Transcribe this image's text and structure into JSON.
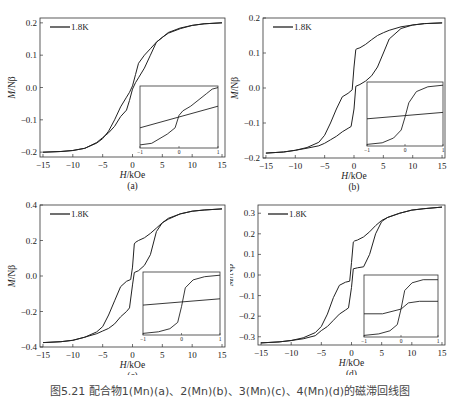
{
  "caption": "图5.21  配合物1(Mn)(a)、2(Mn)(b)、3(Mn)(c)、4(Mn)(d)的磁滞回线图",
  "chart_data": [
    {
      "id": "a",
      "label": "(a)",
      "type": "line",
      "title": "",
      "xlabel": "H/kOe",
      "ylabel": "M/Nβ",
      "xlim": [
        -15.5,
        15.5
      ],
      "ylim": [
        -0.215,
        0.215
      ],
      "xticks": [
        -15,
        -10,
        -5,
        0,
        5,
        10,
        15
      ],
      "yticks": [
        -0.2,
        -0.1,
        0.0,
        0.1,
        0.2
      ],
      "ytick_labels": [
        "-0.2",
        "-0.1",
        "0.0",
        "0.1",
        "0.2"
      ],
      "legend": [
        "1.8K"
      ],
      "legend_position": "upper left",
      "grid": false,
      "series": [
        {
          "name": "1.8K (upper branch)",
          "x": [
            -15,
            -12,
            -10,
            -8,
            -6,
            -5,
            -4,
            -3,
            -2,
            -1,
            -0.5,
            0,
            0.5,
            1,
            2,
            3,
            4,
            5,
            6,
            8,
            10,
            12,
            15
          ],
          "y": [
            -0.2,
            -0.198,
            -0.195,
            -0.188,
            -0.172,
            -0.158,
            -0.135,
            -0.1,
            -0.06,
            -0.03,
            -0.015,
            0.005,
            0.04,
            0.075,
            0.1,
            0.12,
            0.14,
            0.155,
            0.168,
            0.182,
            0.192,
            0.197,
            0.2
          ]
        },
        {
          "name": "1.8K (lower branch)",
          "x": [
            -15,
            -12,
            -10,
            -8,
            -6,
            -5,
            -4,
            -3,
            -2,
            -1,
            -0.5,
            0,
            0.5,
            1,
            2,
            3,
            4,
            5,
            6,
            8,
            10,
            12,
            15
          ],
          "y": [
            -0.2,
            -0.198,
            -0.195,
            -0.188,
            -0.17,
            -0.155,
            -0.14,
            -0.12,
            -0.09,
            -0.07,
            -0.04,
            -0.005,
            0.015,
            0.03,
            0.06,
            0.1,
            0.14,
            0.155,
            0.17,
            0.184,
            0.192,
            0.197,
            0.2
          ]
        }
      ],
      "inset": {
        "xlim": [
          -1,
          1
        ],
        "xtick_labels": [
          "-1",
          "0",
          "1"
        ],
        "series": [
          {
            "name": "virgin/linear",
            "x": [
              -1,
              1
            ],
            "y": [
              -0.35,
              0.35
            ]
          },
          {
            "name": "loop",
            "x": [
              -1,
              -0.7,
              -0.3,
              -0.1,
              0,
              0.1,
              0.3,
              0.7,
              0.85,
              1
            ],
            "y": [
              -0.9,
              -0.85,
              -0.55,
              -0.35,
              0.05,
              0.2,
              0.35,
              0.75,
              0.9,
              0.95
            ]
          }
        ]
      }
    },
    {
      "id": "b",
      "label": "(b)",
      "type": "line",
      "title": "",
      "xlabel": "H/kOe",
      "ylabel": "M/Nβ",
      "xlim": [
        -15.5,
        15.5
      ],
      "ylim": [
        -0.2,
        0.2
      ],
      "xticks": [
        -15,
        -10,
        -5,
        0,
        5,
        10,
        15
      ],
      "yticks": [
        -0.2,
        -0.1,
        0.0,
        0.1,
        0.2
      ],
      "ytick_labels": [
        "-0.2",
        "-0.1",
        "0.0",
        "0.1",
        "0.2"
      ],
      "legend": [
        "1.8K"
      ],
      "legend_position": "upper left",
      "grid": false,
      "series": [
        {
          "name": "1.8K (upper branch)",
          "x": [
            -15,
            -12,
            -10,
            -8,
            -6,
            -5,
            -4,
            -3,
            -2,
            -1,
            -0.3,
            0,
            0.3,
            0.5,
            1,
            2,
            3,
            4,
            5,
            6,
            8,
            10,
            12,
            15
          ],
          "y": [
            -0.186,
            -0.183,
            -0.178,
            -0.17,
            -0.155,
            -0.135,
            -0.1,
            -0.06,
            -0.025,
            -0.015,
            -0.005,
            0.06,
            0.11,
            0.112,
            0.115,
            0.125,
            0.138,
            0.15,
            0.158,
            0.165,
            0.175,
            0.18,
            0.184,
            0.186
          ]
        },
        {
          "name": "1.8K (lower branch)",
          "x": [
            -15,
            -12,
            -10,
            -8,
            -6,
            -5,
            -4,
            -3,
            -2,
            -1,
            -0.5,
            0,
            0.3,
            1,
            2,
            3,
            4,
            5,
            6,
            8,
            10,
            12,
            15
          ],
          "y": [
            -0.186,
            -0.183,
            -0.178,
            -0.172,
            -0.165,
            -0.158,
            -0.148,
            -0.138,
            -0.125,
            -0.115,
            -0.11,
            -0.06,
            0.005,
            0.01,
            0.02,
            0.035,
            0.06,
            0.1,
            0.14,
            0.17,
            0.18,
            0.184,
            0.186
          ]
        }
      ],
      "inset": {
        "xlim": [
          -1,
          1
        ],
        "xtick_labels": [
          "-1",
          "0",
          "1"
        ],
        "series": [
          {
            "name": "virgin/linear",
            "x": [
              -1,
              1
            ],
            "y": [
              -0.15,
              0.05
            ]
          },
          {
            "name": "loop",
            "x": [
              -1,
              -0.6,
              -0.3,
              -0.1,
              0,
              0.1,
              0.3,
              0.6,
              1
            ],
            "y": [
              -0.95,
              -0.9,
              -0.75,
              -0.5,
              -0.1,
              0.35,
              0.7,
              0.85,
              0.9
            ]
          }
        ]
      }
    },
    {
      "id": "c",
      "label": "(c)",
      "type": "line",
      "title": "",
      "xlabel": "H/kOe",
      "ylabel": "M/Nβ",
      "xlim": [
        -15.5,
        15.5
      ],
      "ylim": [
        -0.4,
        0.4
      ],
      "xticks": [
        -15,
        -10,
        -5,
        0,
        5,
        10,
        15
      ],
      "yticks": [
        -0.4,
        -0.2,
        0.0,
        0.2,
        0.4
      ],
      "ytick_labels": [
        "-0.4",
        "-0.2",
        "0.0",
        "0.2",
        "0.4"
      ],
      "legend": [
        "1.8K"
      ],
      "legend_position": "upper left",
      "grid": false,
      "series": [
        {
          "name": "1.8K (upper branch)",
          "x": [
            -15,
            -12,
            -10,
            -8,
            -6,
            -5,
            -4,
            -3,
            -2,
            -1,
            -0.3,
            0,
            0.3,
            0.5,
            1,
            2,
            3,
            4,
            5,
            6,
            8,
            10,
            12,
            15
          ],
          "y": [
            -0.375,
            -0.37,
            -0.362,
            -0.345,
            -0.315,
            -0.285,
            -0.22,
            -0.14,
            -0.06,
            -0.03,
            -0.02,
            0.05,
            0.18,
            0.19,
            0.2,
            0.215,
            0.24,
            0.27,
            0.3,
            0.32,
            0.35,
            0.365,
            0.372,
            0.378
          ]
        },
        {
          "name": "1.8K (lower branch)",
          "x": [
            -15,
            -12,
            -10,
            -8,
            -6,
            -5,
            -4,
            -3,
            -2,
            -1,
            -0.5,
            0,
            0.3,
            1,
            2,
            3,
            4,
            5,
            6,
            8,
            10,
            12,
            15
          ],
          "y": [
            -0.375,
            -0.37,
            -0.362,
            -0.345,
            -0.325,
            -0.31,
            -0.295,
            -0.27,
            -0.23,
            -0.2,
            -0.18,
            -0.05,
            0.02,
            0.03,
            0.06,
            0.12,
            0.25,
            0.3,
            0.325,
            0.35,
            0.365,
            0.372,
            0.378
          ]
        }
      ],
      "inset": {
        "xlim": [
          -1,
          1
        ],
        "xtick_labels": [
          "-1",
          "0",
          "1"
        ],
        "series": [
          {
            "name": "virgin/linear",
            "x": [
              -1,
              1
            ],
            "y": [
              -0.05,
              0.15
            ]
          },
          {
            "name": "loop",
            "x": [
              -1,
              -0.6,
              -0.3,
              -0.1,
              0,
              0.1,
              0.3,
              0.6,
              1
            ],
            "y": [
              -0.95,
              -0.9,
              -0.8,
              -0.6,
              -0.1,
              0.5,
              0.75,
              0.85,
              0.9
            ]
          }
        ]
      }
    },
    {
      "id": "d",
      "label": "(d)",
      "type": "line",
      "title": "",
      "xlabel": "H/kOe",
      "ylabel": "M/Nβ",
      "xlim": [
        -15.5,
        15.5
      ],
      "ylim": [
        -0.34,
        0.34
      ],
      "xticks": [
        -15,
        -10,
        -5,
        0,
        5,
        10,
        15
      ],
      "yticks": [
        -0.3,
        -0.2,
        -0.1,
        0.0,
        0.1,
        0.2,
        0.3
      ],
      "ytick_labels": [
        "-0.3",
        "-0.2",
        "-0.1",
        "0.0",
        "0.1",
        "0.2",
        "0.3"
      ],
      "legend": [
        "1.8K"
      ],
      "legend_position": "upper left",
      "grid": false,
      "series": [
        {
          "name": "1.8K (upper branch)",
          "x": [
            -15,
            -12,
            -10,
            -8,
            -6,
            -5,
            -4,
            -3,
            -2,
            -1,
            -0.3,
            0,
            0.3,
            0.5,
            1,
            2,
            3,
            4,
            5,
            6,
            8,
            10,
            12,
            15
          ],
          "y": [
            -0.33,
            -0.325,
            -0.318,
            -0.305,
            -0.28,
            -0.25,
            -0.19,
            -0.11,
            -0.05,
            -0.035,
            -0.03,
            0.06,
            0.16,
            0.165,
            0.17,
            0.185,
            0.21,
            0.24,
            0.265,
            0.28,
            0.3,
            0.315,
            0.322,
            0.33
          ]
        },
        {
          "name": "1.8K (lower branch)",
          "x": [
            -15,
            -12,
            -10,
            -8,
            -6,
            -5,
            -4,
            -3,
            -2,
            -1,
            -0.5,
            0,
            0.3,
            1,
            2,
            3,
            4,
            5,
            6,
            8,
            10,
            12,
            15
          ],
          "y": [
            -0.33,
            -0.325,
            -0.318,
            -0.31,
            -0.295,
            -0.27,
            -0.25,
            -0.22,
            -0.19,
            -0.17,
            -0.16,
            -0.06,
            0.03,
            0.035,
            0.04,
            0.1,
            0.2,
            0.26,
            0.28,
            0.3,
            0.315,
            0.322,
            0.33
          ]
        }
      ],
      "inset": {
        "xlim": [
          -1,
          1
        ],
        "xtick_labels": [
          "-1",
          "0",
          "1"
        ],
        "series": [
          {
            "name": "virgin/linear",
            "x": [
              -1,
              -0.5,
              0,
              0.2,
              0.5,
              1
            ],
            "y": [
              -0.25,
              -0.25,
              -0.1,
              0.1,
              0.15,
              0.15
            ]
          },
          {
            "name": "loop",
            "x": [
              -1,
              -0.6,
              -0.3,
              -0.1,
              0,
              0.1,
              0.3,
              0.6,
              1
            ],
            "y": [
              -0.95,
              -0.9,
              -0.8,
              -0.6,
              -0.1,
              0.5,
              0.75,
              0.85,
              0.85
            ]
          }
        ]
      }
    }
  ]
}
